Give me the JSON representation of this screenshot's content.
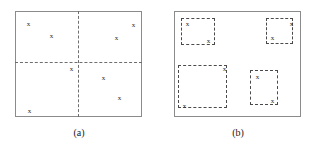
{
  "figure": {
    "title": "",
    "background_color": "#ffffff",
    "frame_color": "#8b8b8b",
    "dash_color": "#6e6e6e",
    "bbox_color": "#4a4a4a",
    "marker_color": "#2b2b2b",
    "marker_glyph": "x"
  },
  "panels": [
    {
      "id": "panel-a",
      "caption": "(a)",
      "frame": {
        "x": 15,
        "y": 11,
        "width": 127,
        "height": 106
      },
      "dividers": [
        {
          "orientation": "vertical",
          "position_x": 78
        },
        {
          "orientation": "horizontal",
          "position_y": 62
        }
      ],
      "points": [
        {
          "x": 25,
          "y": 21,
          "glyph": "x"
        },
        {
          "x": 48,
          "y": 33,
          "glyph": "x"
        },
        {
          "x": 130,
          "y": 22,
          "glyph": "x"
        },
        {
          "x": 113,
          "y": 35,
          "glyph": "x"
        },
        {
          "x": 68,
          "y": 66,
          "glyph": "x"
        },
        {
          "x": 26,
          "y": 108,
          "glyph": "x"
        },
        {
          "x": 100,
          "y": 75,
          "glyph": "x"
        },
        {
          "x": 116,
          "y": 95,
          "glyph": "x"
        }
      ]
    },
    {
      "id": "panel-b",
      "caption": "(b)",
      "frame": {
        "x": 174,
        "y": 11,
        "width": 127,
        "height": 106
      },
      "boxes": [
        {
          "id": "cluster-1",
          "x": 181,
          "y": 18,
          "width": 34,
          "height": 27
        },
        {
          "id": "cluster-2",
          "x": 266,
          "y": 18,
          "width": 27,
          "height": 26
        },
        {
          "id": "cluster-3",
          "x": 178,
          "y": 65,
          "width": 49,
          "height": 43
        },
        {
          "id": "cluster-4",
          "x": 250,
          "y": 70,
          "width": 28,
          "height": 35
        }
      ],
      "points": [
        {
          "x": 184,
          "y": 21,
          "glyph": "x"
        },
        {
          "x": 205,
          "y": 38,
          "glyph": "x"
        },
        {
          "x": 288,
          "y": 21,
          "glyph": "x"
        },
        {
          "x": 269,
          "y": 35,
          "glyph": "x"
        },
        {
          "x": 221,
          "y": 66,
          "glyph": "x"
        },
        {
          "x": 181,
          "y": 103,
          "glyph": "x"
        },
        {
          "x": 254,
          "y": 74,
          "glyph": "x"
        },
        {
          "x": 269,
          "y": 98,
          "glyph": "x"
        }
      ]
    }
  ],
  "captions": [
    {
      "text": "(a)",
      "x": 59,
      "y": 127
    },
    {
      "text": "(b)",
      "x": 218,
      "y": 127
    }
  ]
}
